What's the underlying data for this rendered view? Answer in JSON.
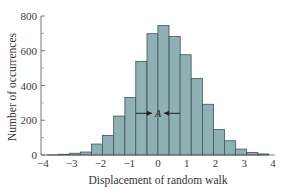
{
  "chart_data": {
    "type": "bar",
    "title": "",
    "xlabel": "Displacement of random walk",
    "ylabel": "Number of occurrences",
    "xlim": [
      -4,
      4
    ],
    "ylim": [
      0,
      800
    ],
    "x_ticks": [
      "-4",
      "-3",
      "-2",
      "-1",
      "0",
      "1",
      "2",
      "3",
      "4"
    ],
    "y_ticks": [
      "0",
      "200",
      "400",
      "600",
      "800"
    ],
    "y_minor_ticks": [
      100,
      300,
      500,
      700
    ],
    "grid": false,
    "legend": null,
    "bin_width": 0.385,
    "bin_centers": [
      -3.66,
      -3.28,
      -2.89,
      -2.51,
      -2.12,
      -1.74,
      -1.35,
      -0.96,
      -0.58,
      -0.19,
      0.19,
      0.58,
      0.96,
      1.35,
      1.74,
      2.12,
      2.51,
      2.89,
      3.28,
      3.66
    ],
    "values": [
      1,
      4,
      10,
      17,
      63,
      113,
      224,
      331,
      539,
      698,
      745,
      682,
      577,
      440,
      292,
      147,
      82,
      34,
      15,
      6
    ],
    "annotation": {
      "text": "A",
      "description": "width arrows marking spread around center",
      "y_value": 240
    },
    "bar_color": "#8fb1b5",
    "edge_color": "#3d5558"
  }
}
